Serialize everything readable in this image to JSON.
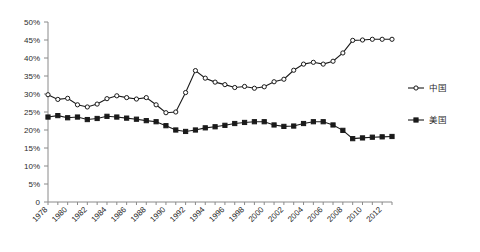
{
  "chart_data": {
    "type": "line",
    "title": "",
    "subtitle": "",
    "xlabel": "",
    "ylabel": "",
    "grid": false,
    "legend_position": "right",
    "ylim": [
      0,
      50
    ],
    "ytick_values": [
      0,
      5,
      10,
      15,
      20,
      25,
      30,
      35,
      40,
      45,
      50
    ],
    "ytick_labels": [
      "0",
      "5%",
      "10%",
      "15%",
      "20%",
      "25%",
      "30%",
      "35%",
      "40%",
      "45%",
      "50%"
    ],
    "xlim": [
      1978,
      2013
    ],
    "x": [
      1978,
      1979,
      1980,
      1981,
      1982,
      1983,
      1984,
      1985,
      1986,
      1987,
      1988,
      1989,
      1990,
      1991,
      1992,
      1993,
      1994,
      1995,
      1996,
      1997,
      1998,
      1999,
      2000,
      2001,
      2002,
      2003,
      2004,
      2005,
      2006,
      2007,
      2008,
      2009,
      2010,
      2011,
      2012,
      2013
    ],
    "xtick_values": [
      1978,
      1980,
      1982,
      1984,
      1986,
      1988,
      1990,
      1992,
      1994,
      1996,
      1998,
      2000,
      2002,
      2004,
      2006,
      2008,
      2010,
      2012
    ],
    "xtick_labels": [
      "1978",
      "1980",
      "1982",
      "1984",
      "1986",
      "1988",
      "1990",
      "1992",
      "1994",
      "1996",
      "1998",
      "2000",
      "2002",
      "2004",
      "2006",
      "2008",
      "2010",
      "2012"
    ],
    "series": [
      {
        "name": "中国",
        "marker": "open-circle",
        "color": "#1a1a1a",
        "values": [
          29.8,
          28.5,
          28.8,
          27.0,
          26.4,
          27.2,
          28.7,
          29.5,
          29.0,
          28.6,
          29.0,
          27.0,
          24.8,
          25.0,
          30.4,
          36.5,
          34.4,
          33.3,
          32.6,
          31.8,
          32.1,
          31.6,
          32.0,
          33.4,
          34.1,
          36.6,
          38.3,
          38.8,
          38.3,
          39.1,
          41.4,
          44.9,
          45.0,
          45.2,
          45.2,
          45.2
        ]
      },
      {
        "name": "美国",
        "marker": "solid-square",
        "color": "#1a1a1a",
        "values": [
          23.6,
          24.0,
          23.4,
          23.6,
          22.9,
          23.2,
          23.8,
          23.6,
          23.3,
          23.0,
          22.6,
          22.3,
          21.2,
          20.0,
          19.6,
          20.0,
          20.6,
          20.9,
          21.3,
          21.8,
          22.1,
          22.3,
          22.3,
          21.4,
          21.0,
          21.1,
          21.8,
          22.3,
          22.3,
          21.4,
          19.9,
          17.6,
          17.8,
          18.0,
          18.1,
          18.2
        ]
      }
    ],
    "legend": [
      {
        "label": "中国",
        "marker": "open-circle"
      },
      {
        "label": "美国",
        "marker": "solid-square"
      }
    ]
  }
}
